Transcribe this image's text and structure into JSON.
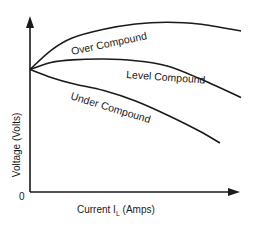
{
  "chart_data": {
    "type": "line",
    "title": "",
    "xlabel": "Current I_L (Amps)",
    "xlabel_main": "Current I",
    "xlabel_sub": "L",
    "xlabel_unit": "(Amps)",
    "ylabel": "Voltage (Volts)",
    "origin_label": "0",
    "grid": false,
    "legend": "none (curves labeled inline)",
    "x_units": "relative (0-100, no tick values shown)",
    "y_units": "relative (0-100, no tick values shown)",
    "xlim": [
      0,
      100
    ],
    "ylim": [
      0,
      100
    ],
    "series": [
      {
        "name": "Over Compound",
        "x": [
          0,
          10,
          20,
          35,
          50,
          65,
          80,
          100
        ],
        "y": [
          70,
          81,
          88,
          93,
          96,
          97,
          96,
          92
        ]
      },
      {
        "name": "Level Compound",
        "x": [
          0,
          10,
          20,
          35,
          50,
          65,
          80,
          100
        ],
        "y": [
          70,
          74,
          75.5,
          76,
          75,
          72,
          65,
          54
        ]
      },
      {
        "name": "Under Compound",
        "x": [
          0,
          10,
          20,
          35,
          50,
          65,
          80,
          90
        ],
        "y": [
          70,
          65.5,
          62,
          58,
          52,
          44,
          35,
          28
        ]
      }
    ],
    "annotations": [
      "Over Compound",
      "Level Compound",
      "Under Compound"
    ]
  },
  "labels": {
    "over": "Over Compound",
    "level": "Level Compound",
    "under": "Under Compound",
    "ylabel": "Voltage (Volts)",
    "xlabel_main": "Current I",
    "xlabel_sub": "L",
    "xlabel_unit": " (Amps)",
    "origin": "0"
  },
  "colors": {
    "line": "#1a1a1a",
    "background": "#ffffff"
  }
}
